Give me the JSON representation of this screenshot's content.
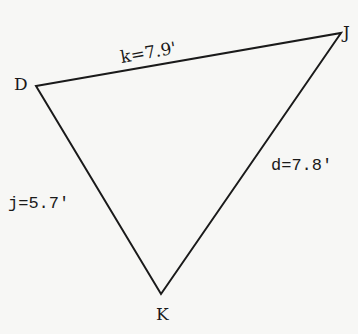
{
  "diagram": {
    "type": "triangle",
    "stroke_color": "#1a1a1a",
    "background": "#f7f7f5",
    "vertices": [
      {
        "name": "D",
        "x": 36,
        "y": 86
      },
      {
        "name": "J",
        "x": 341,
        "y": 33
      },
      {
        "name": "K",
        "x": 161,
        "y": 294
      }
    ],
    "vertex_labels": {
      "D": "D",
      "J": "J",
      "K": "K"
    },
    "sides": {
      "k": {
        "label": "k=7.9'",
        "from": "D",
        "to": "J"
      },
      "d": {
        "label": "d=7.8'",
        "from": "J",
        "to": "K"
      },
      "j": {
        "label": "j=5.7'",
        "from": "D",
        "to": "K"
      }
    }
  }
}
